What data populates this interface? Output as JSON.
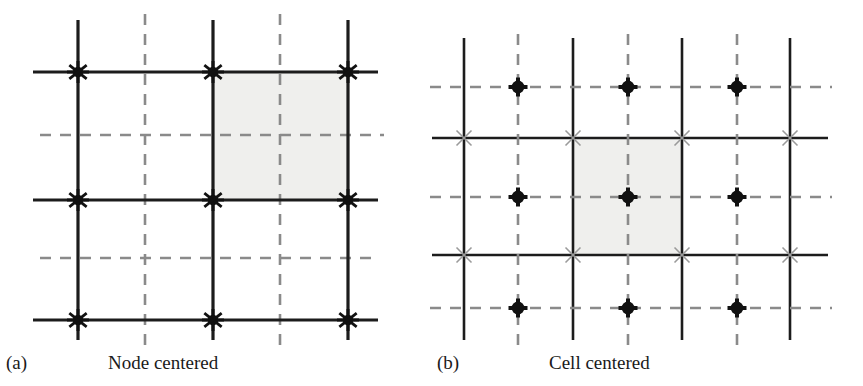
{
  "figure": {
    "background": "#ffffff",
    "ink_color": "#1c1c1c",
    "dash_color": "#8a8a8a",
    "shade_color": "#eeeeec",
    "xmark_color": "#9a9a9a",
    "panels": [
      {
        "id": "a",
        "label": "(a)",
        "title": "Node centered",
        "marker_type": "asterisk-star",
        "marker_description": "six-pointed filled star at every solid grid intersection",
        "solid_x": [
          78,
          213,
          348
        ],
        "solid_y": [
          72,
          200,
          320
        ],
        "solid_x_extent": [
          20,
          340
        ],
        "solid_y_extent": [
          33,
          378
        ],
        "dashed_x": [
          145,
          280
        ],
        "dashed_y": [
          135,
          258
        ],
        "dashed_x_extent": [
          14,
          346
        ],
        "dashed_y_extent": [
          40,
          384
        ],
        "dashed_y_extent_second": [
          40,
          372
        ],
        "shaded_cell": {
          "x": 213,
          "y": 72,
          "w": 135,
          "h": 128
        },
        "nodes": [
          {
            "x": 78,
            "y": 72
          },
          {
            "x": 213,
            "y": 72
          },
          {
            "x": 348,
            "y": 72
          },
          {
            "x": 78,
            "y": 200
          },
          {
            "x": 213,
            "y": 200
          },
          {
            "x": 348,
            "y": 200
          },
          {
            "x": 78,
            "y": 320
          },
          {
            "x": 213,
            "y": 320
          },
          {
            "x": 348,
            "y": 320
          }
        ]
      },
      {
        "id": "b",
        "label": "(b)",
        "title": "Cell centered",
        "marker_type": "filled-circle",
        "marker_description": "filled circle at every dashed (cell-center) intersection; light x at solid intersections",
        "solid_x": [
          464,
          573,
          682,
          790
        ],
        "solid_y": [
          138,
          255
        ],
        "solid_x_extent": [
          38,
          340
        ],
        "solid_y_extent": [
          432,
          808
        ],
        "dashed_x": [
          518,
          628,
          737
        ],
        "dashed_y": [
          87,
          197,
          308
        ],
        "dashed_x_extent": [
          24,
          350
        ],
        "dashed_y_extent": [
          430,
          820
        ],
        "shaded_cell": {
          "x": 573,
          "y": 138,
          "w": 109,
          "h": 117
        },
        "centers": [
          {
            "x": 518,
            "y": 87
          },
          {
            "x": 628,
            "y": 87
          },
          {
            "x": 737,
            "y": 87
          },
          {
            "x": 518,
            "y": 197
          },
          {
            "x": 628,
            "y": 197
          },
          {
            "x": 737,
            "y": 197
          },
          {
            "x": 518,
            "y": 308
          },
          {
            "x": 628,
            "y": 308
          },
          {
            "x": 737,
            "y": 308
          }
        ],
        "xmarks": [
          {
            "x": 464,
            "y": 138
          },
          {
            "x": 573,
            "y": 138
          },
          {
            "x": 682,
            "y": 138
          },
          {
            "x": 790,
            "y": 138
          },
          {
            "x": 464,
            "y": 255
          },
          {
            "x": 573,
            "y": 255
          },
          {
            "x": 682,
            "y": 255
          },
          {
            "x": 790,
            "y": 255
          }
        ]
      }
    ]
  }
}
